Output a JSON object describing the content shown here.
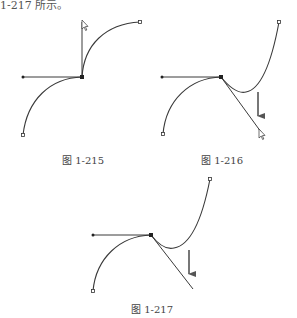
{
  "page": {
    "top_text": "1-217 所示。"
  },
  "figures": [
    {
      "id": "fig-1-215",
      "caption": "图 1-215"
    },
    {
      "id": "fig-1-216",
      "caption": "图 1-216"
    },
    {
      "id": "fig-1-217",
      "caption": "图 1-217"
    }
  ],
  "style": {
    "stroke": "#3a3a3a",
    "arrow": "#555555"
  }
}
